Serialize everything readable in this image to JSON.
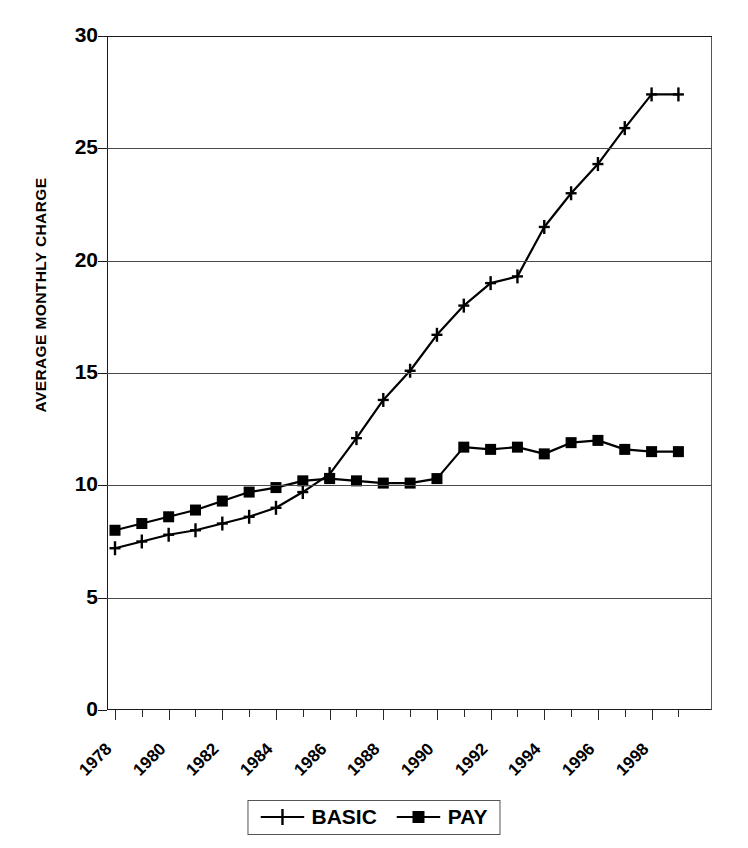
{
  "chart_data": {
    "type": "line",
    "title": "",
    "xlabel": "",
    "ylabel": "AVERAGE MONTHLY CHARGE",
    "ylim": [
      0,
      30
    ],
    "xlim": [
      1978,
      1999
    ],
    "yticks": [
      0,
      5,
      10,
      15,
      20,
      25,
      30
    ],
    "xtick_labels": [
      "1978",
      "1980",
      "1982",
      "1984",
      "1986",
      "1988",
      "1990",
      "1992",
      "1994",
      "1996",
      "1998"
    ],
    "grid": true,
    "legend_position": "bottom",
    "x": [
      1978,
      1979,
      1980,
      1981,
      1982,
      1983,
      1984,
      1985,
      1986,
      1987,
      1988,
      1989,
      1990,
      1991,
      1992,
      1993,
      1994,
      1995,
      1996,
      1997,
      1998,
      1999
    ],
    "series": [
      {
        "name": "BASIC",
        "marker": "plus",
        "color": "#000000",
        "values": [
          7.2,
          7.5,
          7.8,
          8.0,
          8.3,
          8.6,
          9.0,
          9.7,
          10.5,
          12.1,
          13.8,
          15.1,
          16.7,
          18.0,
          19.0,
          19.3,
          21.5,
          23.0,
          24.3,
          25.9,
          27.4,
          27.4
        ]
      },
      {
        "name": "PAY",
        "marker": "square",
        "color": "#000000",
        "values": [
          8.0,
          8.3,
          8.6,
          8.9,
          9.3,
          9.7,
          9.9,
          10.2,
          10.3,
          10.2,
          10.1,
          10.1,
          10.3,
          11.7,
          11.6,
          11.7,
          11.4,
          11.9,
          12.0,
          11.6,
          11.5,
          11.5
        ]
      }
    ]
  },
  "legend": {
    "items": [
      {
        "label": "BASIC",
        "marker": "plus"
      },
      {
        "label": "PAY",
        "marker": "square"
      }
    ]
  }
}
